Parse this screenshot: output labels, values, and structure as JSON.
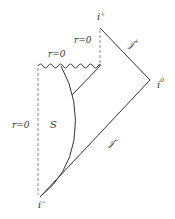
{
  "diagram": {
    "type": "penrose-diagram",
    "labels": {
      "i_plus": "i",
      "i_plus_sup": "+",
      "i_zero": "i",
      "i_zero_sup": "0",
      "i_minus": "i",
      "i_minus_sup": "−",
      "scri_plus": "𝒥",
      "scri_plus_sup": "+",
      "scri_minus": "𝒥",
      "scri_minus_sup": "−",
      "r0_top": "r=0",
      "r0_singularity": "r=0",
      "r0_left": "r=0",
      "star_surface": "S"
    },
    "colors": {
      "line": "#333333",
      "dashed": "#888888"
    }
  }
}
